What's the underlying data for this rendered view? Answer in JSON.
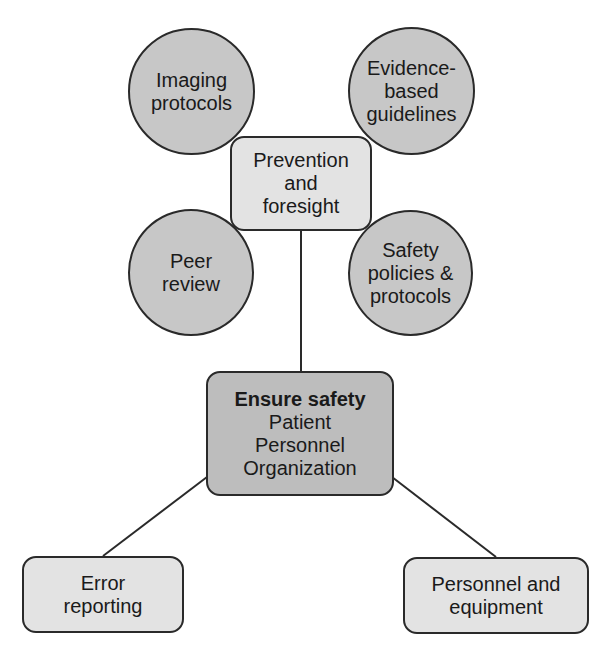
{
  "diagram": {
    "colors": {
      "circle_fill": "#c7c7c7",
      "light_box_fill": "#e3e3e3",
      "center_box_fill": "#bdbdbd",
      "stroke": "#2a2a2a"
    },
    "circles": [
      {
        "id": "imaging-protocols",
        "lines": [
          "Imaging",
          "protocols"
        ]
      },
      {
        "id": "evidence-based-guidelines",
        "lines": [
          "Evidence-",
          "based",
          "guidelines"
        ]
      },
      {
        "id": "peer-review",
        "lines": [
          "Peer",
          "review"
        ]
      },
      {
        "id": "safety-policies-protocols",
        "lines": [
          "Safety",
          "policies &",
          "protocols"
        ]
      }
    ],
    "prevention": {
      "lines": [
        "Prevention",
        "and",
        "foresight"
      ]
    },
    "center": {
      "title": "Ensure safety",
      "lines": [
        "Patient",
        "Personnel",
        "Organization"
      ]
    },
    "bottom_left": {
      "lines": [
        "Error",
        "reporting"
      ]
    },
    "bottom_right": {
      "lines": [
        "Personnel and",
        "equipment"
      ]
    },
    "connections": [
      {
        "from": "prevention-and-foresight",
        "to": "ensure-safety"
      },
      {
        "from": "ensure-safety",
        "to": "error-reporting"
      },
      {
        "from": "ensure-safety",
        "to": "personnel-and-equipment"
      }
    ]
  }
}
